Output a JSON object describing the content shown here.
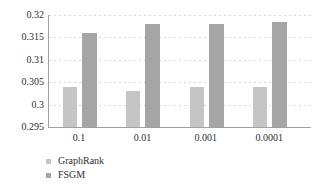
{
  "chart_data": {
    "type": "bar",
    "title": "",
    "xlabel": "",
    "ylabel": "",
    "categories": [
      "0.1",
      "0.01",
      "0.001",
      "0.0001"
    ],
    "series": [
      {
        "name": "GraphRank",
        "color": "#c6c5c5",
        "values": [
          0.304,
          0.303,
          0.304,
          0.304
        ]
      },
      {
        "name": "FSGM",
        "color": "#a6a5a5",
        "values": [
          0.316,
          0.318,
          0.318,
          0.3185
        ]
      }
    ],
    "ylim": [
      0.295,
      0.32
    ],
    "ytick_step": 0.005,
    "ytick_labels": [
      "0.32",
      "0.315",
      "0.31",
      "0.305",
      "0.3",
      "0.295"
    ],
    "grid": "horizontal-dotted",
    "legend_position": "bottom-left",
    "colors": {
      "axis": "#a0a0a0",
      "gridline": "#d8d8d8",
      "text": "#2e2e2e"
    }
  }
}
